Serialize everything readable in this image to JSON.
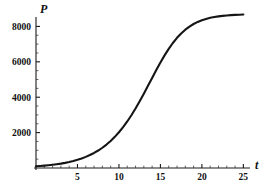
{
  "chart_data": {
    "type": "line",
    "title": "",
    "subtitle": "",
    "xlabel": "t",
    "ylabel": "P",
    "xlim": [
      0,
      25.8
    ],
    "ylim": [
      0,
      8250
    ],
    "grid": false,
    "legend": "none",
    "annotations": [],
    "x_ticks": [
      {
        "value": 5,
        "label": "5"
      },
      {
        "value": 10,
        "label": "10"
      },
      {
        "value": 15,
        "label": "15"
      },
      {
        "value": 20,
        "label": "20"
      },
      {
        "value": 25,
        "label": "25"
      }
    ],
    "y_ticks": [
      {
        "value": 2000,
        "label": "2000"
      },
      {
        "value": 4000,
        "label": "4000"
      },
      {
        "value": 6000,
        "label": "6000"
      },
      {
        "value": 8000,
        "label": "8000"
      }
    ],
    "x_minor_step": 1,
    "y_minor_step": 500,
    "series": [
      {
        "name": "logistic growth",
        "color": "#151515",
        "carrying_capacity": 8000,
        "inflection_t": 10.5,
        "x": [
          0,
          0.5,
          1,
          1.5,
          2,
          2.5,
          3,
          3.5,
          4,
          4.5,
          5,
          5.5,
          6,
          6.5,
          7,
          7.5,
          8,
          8.5,
          9,
          9.5,
          10,
          10.5,
          11,
          11.5,
          12,
          12.5,
          13,
          13.5,
          14,
          14.5,
          15,
          15.5,
          16,
          16.5,
          17,
          17.5,
          18,
          18.5,
          19,
          19.5,
          20,
          20.5,
          21,
          21.5,
          22,
          22.5,
          23,
          23.5,
          24,
          24.5,
          25
        ],
        "values": [
          96,
          113,
          132,
          155,
          181,
          212,
          248,
          290,
          339,
          396,
          462,
          539,
          628,
          731,
          850,
          987,
          1144,
          1324,
          1528,
          1759,
          2019,
          2309,
          2630,
          2982,
          3364,
          3772,
          4201,
          4644,
          5092,
          5535,
          5962,
          6364,
          6733,
          7064,
          7355,
          7605,
          7816,
          7992,
          8137,
          8254,
          8349,
          8425,
          8485,
          8532,
          8569,
          8598,
          8621,
          8638,
          8652,
          8662,
          8670
        ]
      }
    ]
  },
  "axis_labels": {
    "x": "t",
    "y": "P"
  },
  "colors": {
    "curve": "#151515",
    "axis": "#1a1a1a",
    "background": "#ffffff",
    "text": "#111111"
  }
}
